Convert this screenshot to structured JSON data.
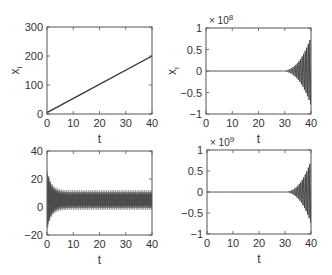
{
  "chart_data": [
    {
      "id": "top-left",
      "type": "line",
      "xlabel": "t",
      "ylabel": "x_i",
      "xlim": [
        0,
        40
      ],
      "ylim": [
        0,
        300
      ],
      "xticks": [
        0,
        10,
        20,
        30,
        40
      ],
      "yticks": [
        0,
        100,
        200,
        300
      ],
      "ytick_labels": [
        "0",
        "100",
        "200",
        "300"
      ],
      "exponent_label": "",
      "box": {
        "x0": 47,
        "y0": 27,
        "x1": 152,
        "y1": 114
      },
      "series": [
        {
          "name": "x_i (linear growth)",
          "kind": "linear",
          "x": [
            0,
            40
          ],
          "y": [
            5,
            200
          ]
        }
      ]
    },
    {
      "id": "top-right",
      "type": "line",
      "xlabel": "t",
      "ylabel": "x_i",
      "xlim": [
        0,
        40
      ],
      "ylim": [
        -1,
        1
      ],
      "xticks": [
        0,
        10,
        20,
        30,
        40
      ],
      "yticks": [
        -1,
        -0.5,
        0,
        0.5,
        1
      ],
      "ytick_labels": [
        "−1",
        "−0.5",
        "0",
        "0.5",
        "1"
      ],
      "exponent_label": "× 10",
      "exponent_power": "8",
      "box": {
        "x0": 206,
        "y0": 28,
        "x1": 311,
        "y1": 114
      },
      "series": [
        {
          "name": "x_i (growing oscillation)",
          "kind": "growing_oscillation",
          "onset": 28,
          "peak_amplitude": 0.8
        }
      ]
    },
    {
      "id": "bottom-left",
      "type": "line",
      "xlabel": "t",
      "ylabel": "",
      "xlim": [
        0,
        40
      ],
      "ylim": [
        -20,
        40
      ],
      "xticks": [
        0,
        10,
        20,
        30,
        40
      ],
      "yticks": [
        -20,
        0,
        20,
        40
      ],
      "ytick_labels": [
        "−20",
        "0",
        "20",
        "40"
      ],
      "exponent_label": "",
      "box": {
        "x0": 47,
        "y0": 151,
        "x1": 152,
        "y1": 235
      },
      "series": [
        {
          "name": "x_i (damped to sustained oscillation)",
          "kind": "settling_oscillation",
          "center": 5,
          "initial_amplitude": 22,
          "steady_amplitude": 7
        }
      ]
    },
    {
      "id": "bottom-right",
      "type": "line",
      "xlabel": "t",
      "ylabel": "",
      "xlim": [
        0,
        40
      ],
      "ylim": [
        -1,
        1
      ],
      "xticks": [
        0,
        10,
        20,
        30,
        40
      ],
      "yticks": [
        -1,
        -0.5,
        0,
        0.5,
        1
      ],
      "ytick_labels": [
        "−1",
        "−0.5",
        "0",
        "0.5",
        "1"
      ],
      "exponent_label": "× 10",
      "exponent_power": "9",
      "box": {
        "x0": 207,
        "y0": 150,
        "x1": 311,
        "y1": 234
      },
      "series": [
        {
          "name": "x_i (growing oscillation)",
          "kind": "growing_oscillation",
          "onset": 29,
          "peak_amplitude": 0.75
        }
      ]
    }
  ],
  "style": {
    "axis_color": "#555555",
    "line_color": "#3a3a3a",
    "text_color": "#333333",
    "background": "#ffffff"
  }
}
